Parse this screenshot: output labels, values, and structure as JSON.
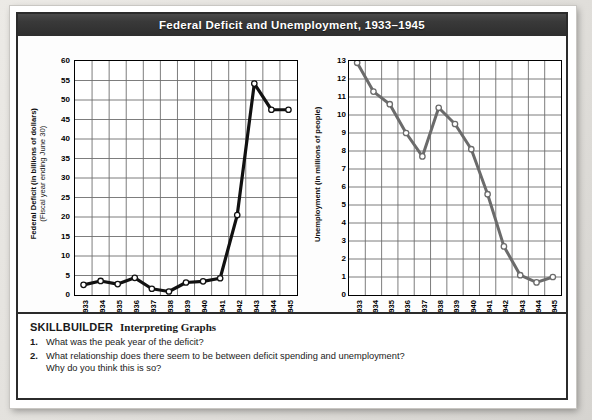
{
  "title": "Federal Deficit and Unemployment, 1933–1945",
  "theme": {
    "title_bar_bg": "#333333",
    "title_text": "#ffffff",
    "card_border": "#2b2b2b",
    "grid": "#6e6e6e",
    "left_line": "#111111",
    "right_line": "#6b6b6b",
    "marker_fill": "#ffffff",
    "page_bg": "#e6e4e0"
  },
  "chart_data": [
    {
      "type": "line",
      "id": "federal-deficit",
      "title": "",
      "ylabel": "Federal Deficit (in billions of dollars)",
      "ylabel_sub": "(Fiscal year ending June 30)",
      "xlabel": "",
      "categories": [
        "1933",
        "1934",
        "1935",
        "1936",
        "1937",
        "1938",
        "1939",
        "1940",
        "1941",
        "1942",
        "1943",
        "1944",
        "1945"
      ],
      "values": [
        2.6,
        3.6,
        2.8,
        4.4,
        1.6,
        0.9,
        3.2,
        3.5,
        4.3,
        20.5,
        54.2,
        47.5,
        47.5
      ],
      "ylim": [
        0,
        60
      ],
      "yticks": [
        0,
        5,
        10,
        15,
        20,
        25,
        30,
        35,
        40,
        45,
        50,
        55,
        60
      ],
      "grid": true,
      "legend": "none",
      "line_color": "#111111"
    },
    {
      "type": "line",
      "id": "unemployment",
      "title": "",
      "ylabel": "Unemployment (in millions of people)",
      "ylabel_sub": "",
      "xlabel": "",
      "categories": [
        "1933",
        "1934",
        "1935",
        "1936",
        "1937",
        "1938",
        "1939",
        "1940",
        "1941",
        "1942",
        "1943",
        "1944",
        "1945"
      ],
      "values": [
        12.9,
        11.3,
        10.6,
        9.0,
        7.7,
        10.4,
        9.5,
        8.1,
        5.6,
        2.7,
        1.1,
        0.7,
        1.0
      ],
      "ylim": [
        0,
        13
      ],
      "yticks": [
        0,
        1,
        2,
        3,
        4,
        5,
        6,
        7,
        8,
        9,
        10,
        11,
        12,
        13
      ],
      "grid": true,
      "legend": "none",
      "line_color": "#6b6b6b"
    }
  ],
  "skillbuilder": {
    "label": "SKILLBUILDER",
    "subtitle": "Interpreting Graphs",
    "questions": [
      {
        "num": "1.",
        "line1": "What was the peak year of the deficit?",
        "line2": ""
      },
      {
        "num": "2.",
        "line1": "What relationship does there seem to be between deficit spending and unemployment?",
        "line2": "Why do you think this is so?"
      }
    ]
  }
}
